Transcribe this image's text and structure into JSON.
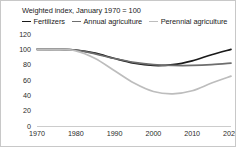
{
  "chart_data": {
    "type": "line",
    "title": "Weighted index, January 1970 = 100",
    "xlabel": "",
    "ylabel": "",
    "xlim": [
      1970,
      2020
    ],
    "ylim": [
      0,
      120
    ],
    "grid": false,
    "legend_position": "top-left",
    "x_ticks": [
      "1970",
      "1980",
      "1990",
      "2000",
      "2010",
      "2020"
    ],
    "y_ticks": [
      "0",
      "20",
      "40",
      "60",
      "80",
      "100",
      "120"
    ],
    "x": [
      1970,
      1975,
      1980,
      1985,
      1990,
      1995,
      2000,
      2005,
      2010,
      2015,
      2020
    ],
    "series": [
      {
        "name": "Fertilizers",
        "color": "#1a1a1a",
        "values": [
          100,
          100,
          99,
          95,
          88,
          82,
          79,
          80,
          85,
          93,
          100
        ]
      },
      {
        "name": "Annual agriculture",
        "color": "#6e6e6e",
        "values": [
          100,
          100,
          99,
          94,
          88,
          83,
          80,
          79,
          79,
          80,
          82
        ]
      },
      {
        "name": "Perennial agriculture",
        "color": "#bdbdbd",
        "values": [
          100,
          100,
          98,
          88,
          72,
          56,
          45,
          42,
          46,
          56,
          65
        ]
      }
    ]
  },
  "axis": {
    "y_tick_values": [
      120,
      100,
      80,
      60,
      40,
      20,
      0
    ],
    "x_tick_values": [
      1970,
      1980,
      1990,
      2000,
      2010,
      2020
    ]
  }
}
